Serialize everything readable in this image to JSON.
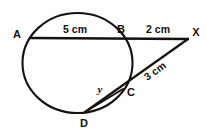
{
  "figure": {
    "stroke_color": "#15110f",
    "background_color": "#ffffff",
    "circle": {
      "center_x": 77.5,
      "center_y": 63,
      "radius_x": 55,
      "radius_y": 50,
      "stroke_width": 2.1
    },
    "points": [
      {
        "id": "A",
        "label": "A",
        "x": 31,
        "y": 38,
        "label_x": 17,
        "label_y": 38
      },
      {
        "id": "B",
        "label": "B",
        "x": 126,
        "y": 38,
        "label_x": 121,
        "label_y": 33
      },
      {
        "id": "X",
        "label": "X",
        "x": 188,
        "y": 39,
        "label_x": 196,
        "label_y": 36
      },
      {
        "id": "C",
        "label": "C",
        "x": 123,
        "y": 89,
        "label_x": 131,
        "label_y": 96
      },
      {
        "id": "D",
        "label": "D",
        "x": 85,
        "y": 112,
        "label_x": 84,
        "label_y": 127
      }
    ],
    "segments": [
      {
        "id": "secant-ABX",
        "from": "A",
        "to": "X",
        "stroke_width": 2.4
      },
      {
        "id": "secant-DCX",
        "from": "D",
        "to": "X",
        "stroke_width": 2.2
      },
      {
        "id": "chord-DC",
        "from": "D",
        "to": "C",
        "stroke_width": 2.0
      }
    ],
    "measurements": [
      {
        "id": "AB",
        "text": "5 cm",
        "x": 75,
        "y": 33,
        "rotation": 0
      },
      {
        "id": "BX",
        "text": "2 cm",
        "x": 158,
        "y": 33,
        "rotation": 0
      },
      {
        "id": "CX",
        "text": "3 cm",
        "x": 157,
        "y": 74,
        "rotation": -36
      },
      {
        "id": "DC",
        "text": "y",
        "x": 100,
        "y": 93,
        "rotation": 0
      }
    ]
  }
}
